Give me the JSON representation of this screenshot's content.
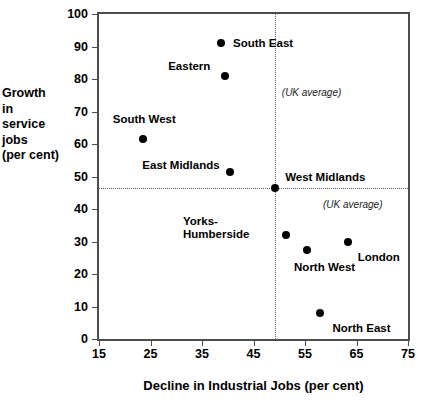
{
  "chart_data": {
    "type": "scatter",
    "title": "",
    "xlabel": "Decline in Industrial Jobs (per cent)",
    "ylabel_lines": [
      "Growth",
      "in",
      "service",
      "jobs",
      "(per cent)"
    ],
    "ylabel": "Growth in service jobs (per cent)",
    "xlim": [
      15,
      75
    ],
    "ylim": [
      0,
      100
    ],
    "xticks": [
      15,
      25,
      35,
      45,
      55,
      65,
      75
    ],
    "yticks": [
      0,
      10,
      20,
      30,
      40,
      50,
      60,
      70,
      80,
      90,
      100
    ],
    "grid": false,
    "legend": "none",
    "points": [
      {
        "name": "South East",
        "x": 38.7,
        "y": 91.0,
        "label": "South East",
        "label_lines": [
          "South East"
        ],
        "label_dx": 12,
        "label_dy": -6
      },
      {
        "name": "Eastern",
        "x": 39.5,
        "y": 81.0,
        "label": "Eastern",
        "label_lines": [
          "Eastern"
        ],
        "label_dx": -57,
        "label_dy": -16
      },
      {
        "name": "South West",
        "x": 23.5,
        "y": 61.5,
        "label": "South West",
        "label_lines": [
          "South West"
        ],
        "label_dx": -30,
        "label_dy": -26
      },
      {
        "name": "East Midlands",
        "x": 40.5,
        "y": 51.5,
        "label": "East Midlands",
        "label_lines": [
          "East Midlands"
        ],
        "label_dx": -88,
        "label_dy": -13
      },
      {
        "name": "West Midlands",
        "x": 49.2,
        "y": 46.5,
        "label": "West Midlands",
        "label_lines": [
          "West Midlands"
        ],
        "label_dx": 10,
        "label_dy": -17
      },
      {
        "name": "Yorks-Humberside",
        "x": 51.3,
        "y": 32.0,
        "label": "Yorks-Humberside",
        "label_lines": [
          "Yorks-",
          "Humberside"
        ],
        "label_dx": -103,
        "label_dy": -20
      },
      {
        "name": "North West",
        "x": 55.4,
        "y": 27.3,
        "label": "North West",
        "label_lines": [
          "North West"
        ],
        "label_dx": -13,
        "label_dy": 11
      },
      {
        "name": "London",
        "x": 63.3,
        "y": 30.0,
        "label": "London",
        "label_lines": [
          "London"
        ],
        "label_dx": 10,
        "label_dy": 9
      },
      {
        "name": "North East",
        "x": 58.0,
        "y": 8.0,
        "label": "North East",
        "label_lines": [
          "North East"
        ],
        "label_dx": 12,
        "label_dy": 9
      }
    ],
    "reference_lines": [
      {
        "name": "uk-average-vertical",
        "orientation": "vertical",
        "value": 49.2,
        "style": "dotted",
        "annotation": "(UK average)"
      },
      {
        "name": "uk-average-horizontal",
        "orientation": "horizontal",
        "value": 46.5,
        "style": "dotted",
        "annotation": "(UK average)"
      }
    ],
    "annotations": [
      {
        "name": "uk-average-vertical-annotation",
        "text": "(UK average)",
        "x": 50.5,
        "y": 75.5
      },
      {
        "name": "uk-average-horizontal-annotation",
        "text": "(UK average)",
        "x": 58.5,
        "y": 41.0
      }
    ],
    "colors": {
      "marker": "#000000",
      "axis": "#4d4d4d",
      "reference_line": "#5a5a5a",
      "background": "#ffffff",
      "text": "#000000"
    }
  },
  "caption": {
    "text": ""
  }
}
